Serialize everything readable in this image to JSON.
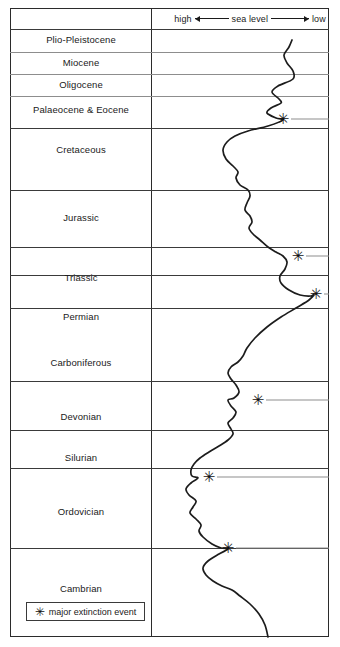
{
  "axis": {
    "high_label": "high",
    "title": "sea level",
    "low_label": "low"
  },
  "legend": {
    "symbol": "✳",
    "label": "major extinction event"
  },
  "periods": [
    {
      "name": "Plio-Pleistocene",
      "top": 29,
      "bottom": 52,
      "label_y": 34
    },
    {
      "name": "Miocene",
      "top": 52,
      "bottom": 74,
      "label_y": 57
    },
    {
      "name": "Oligocene",
      "top": 74,
      "bottom": 96,
      "label_y": 79
    },
    {
      "name": "Palaeocene & Eocene",
      "top": 96,
      "bottom": 128,
      "label_y": 104
    },
    {
      "name": "Cretaceous",
      "top": 128,
      "bottom": 190,
      "label_y": 144
    },
    {
      "name": "Jurassic",
      "top": 190,
      "bottom": 247,
      "label_y": 212
    },
    {
      "name": "Triassic",
      "top": 247,
      "bottom": 275,
      "label_y": 272
    },
    {
      "name": "Permian",
      "top": 275,
      "bottom": 308,
      "label_y": 311
    },
    {
      "name": "Carboniferous",
      "top": 308,
      "bottom": 381,
      "label_y": 357
    },
    {
      "name": "Devonian",
      "top": 381,
      "bottom": 430,
      "label_y": 411
    },
    {
      "name": "Silurian",
      "top": 430,
      "bottom": 468,
      "label_y": 452
    },
    {
      "name": "Ordovician",
      "top": 468,
      "bottom": 548,
      "label_y": 506
    },
    {
      "name": "Cambrian",
      "top": 548,
      "bottom": 637,
      "label_y": 583
    }
  ],
  "chart_data": {
    "type": "line",
    "xlabel": "sea level (high at left, low at right)",
    "ylabel": "geological period",
    "orientation": "vertical",
    "grid": true,
    "legend_position": "bottom-left",
    "x_axis_direction": "high-to-low left-to-right",
    "plot_x_range_px": [
      151,
      329
    ],
    "categories": [
      "Plio-Pleistocene",
      "Miocene",
      "Oligocene",
      "Palaeocene & Eocene",
      "Cretaceous",
      "Jurassic",
      "Triassic",
      "Permian",
      "Carboniferous",
      "Devonian",
      "Silurian",
      "Ordovician",
      "Cambrian"
    ],
    "sealevel_curve_points": [
      [
        292,
        40
      ],
      [
        289,
        47
      ],
      [
        284,
        55
      ],
      [
        287,
        63
      ],
      [
        293,
        71
      ],
      [
        293,
        79
      ],
      [
        278,
        86
      ],
      [
        272,
        92
      ],
      [
        279,
        99
      ],
      [
        281,
        103
      ],
      [
        271,
        108
      ],
      [
        267,
        113
      ],
      [
        276,
        118
      ],
      [
        283,
        120
      ],
      [
        268,
        126
      ],
      [
        248,
        131
      ],
      [
        235,
        136
      ],
      [
        227,
        142
      ],
      [
        223,
        150
      ],
      [
        226,
        159
      ],
      [
        233,
        166
      ],
      [
        238,
        172
      ],
      [
        236,
        178
      ],
      [
        240,
        185
      ],
      [
        248,
        190
      ],
      [
        250,
        196
      ],
      [
        247,
        203
      ],
      [
        245,
        210
      ],
      [
        250,
        216
      ],
      [
        252,
        222
      ],
      [
        249,
        228
      ],
      [
        253,
        234
      ],
      [
        260,
        240
      ],
      [
        268,
        247
      ],
      [
        276,
        252
      ],
      [
        283,
        256
      ],
      [
        287,
        262
      ],
      [
        285,
        269
      ],
      [
        280,
        276
      ],
      [
        281,
        283
      ],
      [
        289,
        290
      ],
      [
        300,
        295
      ],
      [
        311,
        296
      ],
      [
        314,
        294
      ],
      [
        309,
        300
      ],
      [
        296,
        308
      ],
      [
        281,
        317
      ],
      [
        267,
        327
      ],
      [
        255,
        338
      ],
      [
        247,
        348
      ],
      [
        243,
        356
      ],
      [
        238,
        362
      ],
      [
        231,
        367
      ],
      [
        228,
        373
      ],
      [
        231,
        379
      ],
      [
        236,
        385
      ],
      [
        239,
        392
      ],
      [
        234,
        398
      ],
      [
        228,
        400
      ],
      [
        231,
        406
      ],
      [
        236,
        412
      ],
      [
        233,
        418
      ],
      [
        228,
        423
      ],
      [
        231,
        429
      ],
      [
        233,
        434
      ],
      [
        228,
        440
      ],
      [
        219,
        446
      ],
      [
        209,
        452
      ],
      [
        200,
        458
      ],
      [
        194,
        464
      ],
      [
        191,
        470
      ],
      [
        192,
        476
      ],
      [
        198,
        478
      ],
      [
        191,
        483
      ],
      [
        186,
        489
      ],
      [
        189,
        495
      ],
      [
        196,
        501
      ],
      [
        193,
        507
      ],
      [
        190,
        513
      ],
      [
        196,
        519
      ],
      [
        201,
        525
      ],
      [
        199,
        531
      ],
      [
        203,
        537
      ],
      [
        212,
        544
      ],
      [
        221,
        548
      ],
      [
        228,
        549
      ],
      [
        219,
        554
      ],
      [
        208,
        561
      ],
      [
        203,
        568
      ],
      [
        206,
        575
      ],
      [
        213,
        581
      ],
      [
        222,
        586
      ],
      [
        232,
        590
      ],
      [
        240,
        596
      ],
      [
        250,
        604
      ],
      [
        259,
        614
      ],
      [
        265,
        625
      ],
      [
        268,
        637
      ]
    ],
    "extinction_events": [
      {
        "label": "end-Cretaceous",
        "x": 283,
        "y": 119,
        "line_to_x": 329
      },
      {
        "label": "end-Triassic",
        "x": 298,
        "y": 256,
        "line_to_x": 329
      },
      {
        "label": "end-Permian",
        "x": 316,
        "y": 294,
        "line_to_x": 329
      },
      {
        "label": "late-Devonian",
        "x": 258,
        "y": 400,
        "line_to_x": 329
      },
      {
        "label": "end-Ordovician",
        "x": 209,
        "y": 477,
        "line_to_x": 329
      },
      {
        "label": "Cambrian",
        "x": 228,
        "y": 548,
        "line_to_x": 329
      }
    ]
  }
}
